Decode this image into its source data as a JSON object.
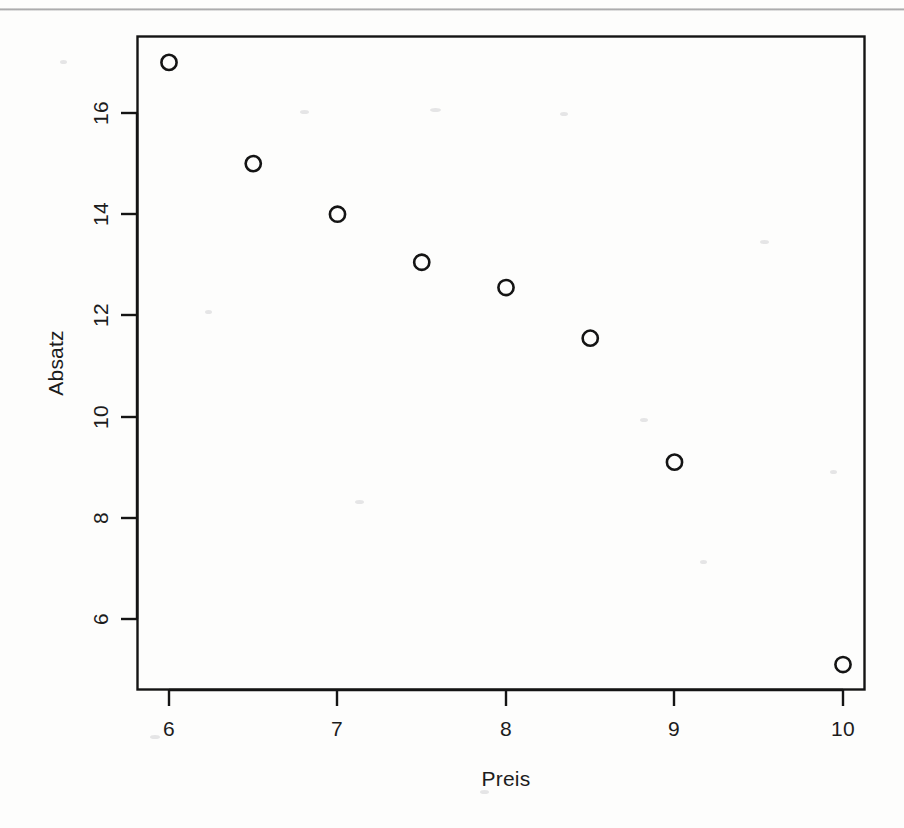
{
  "chart_data": {
    "type": "scatter",
    "title": "",
    "xlabel": "Preis",
    "ylabel": "Absatz",
    "x": [
      6.0,
      6.5,
      7.0,
      7.5,
      8.0,
      8.5,
      9.0,
      10.0
    ],
    "values": [
      17.0,
      15.0,
      14.0,
      13.05,
      12.55,
      11.55,
      9.1,
      5.1
    ],
    "points": [
      {
        "x": 6.0,
        "y": 17.0
      },
      {
        "x": 6.5,
        "y": 15.0
      },
      {
        "x": 7.0,
        "y": 14.0
      },
      {
        "x": 7.5,
        "y": 13.05
      },
      {
        "x": 8.0,
        "y": 12.55
      },
      {
        "x": 8.5,
        "y": 11.55
      },
      {
        "x": 9.0,
        "y": 9.1
      },
      {
        "x": 10.0,
        "y": 5.1
      }
    ],
    "xticks": [
      6,
      7,
      8,
      9,
      10
    ],
    "xtick_labels": [
      "6",
      "7",
      "8",
      "9",
      "10"
    ],
    "yticks": [
      6,
      8,
      10,
      12,
      14,
      16
    ],
    "ytick_labels": [
      "6",
      "8",
      "10",
      "12",
      "14",
      "16"
    ],
    "xlim": [
      5.62,
      10.25
    ],
    "ylim": [
      4.59,
      17.54
    ],
    "grid": false,
    "legend": null,
    "marker": "open-circle",
    "marker_color": "#141414",
    "frame_color": "#141414",
    "background": "#ffffff"
  },
  "axis": {
    "x_title": "Preis",
    "y_title": "Absatz"
  },
  "colors": {
    "ink": "#141414",
    "paper": "#fdfdfc",
    "scan_artifact": "#78787a"
  }
}
